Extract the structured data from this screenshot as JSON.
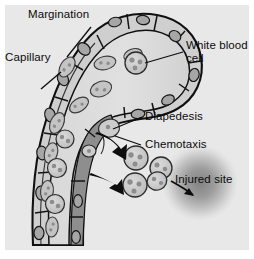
{
  "figure": {
    "background_color": "#ffffff",
    "panel_color": "#e8e8e8"
  },
  "labels": {
    "margination": "Margination",
    "capillary": "Capillary",
    "white_blood_cell_line1": "White blood",
    "white_blood_cell_line2": "cell",
    "diapedesis": "Diapedesis",
    "chemotaxis": "Chemotaxis",
    "injured_site": "Injured site"
  },
  "colors": {
    "ink": "#0b0b0b",
    "vessel_wall": "#b9b9b9",
    "vessel_lumen": "#dcdcdc",
    "vessel_dark_band": "#8a8a8a",
    "red_blood_cell": "#c2c2c2",
    "red_blood_cell_detail": "#8e8e8e",
    "white_blood_cell": "#cfcfcf",
    "white_blood_cell_nucleus": "#909090",
    "endothelial_nucleus": "#9a9a9a",
    "injury_center": "#8f8f8f",
    "background": "#e8e8e8"
  },
  "structures": {
    "vessel_name": "capillary-loop",
    "vessel_description": "hairpin capillary loop running up, arching right, and descending",
    "migrating_cells_outside": 4,
    "red_blood_cells_in_lumen": 11,
    "endothelial_nuclei": 12,
    "arrows": [
      {
        "name": "chemotaxis-arrow-upper",
        "from": "vessel wall",
        "to": "migrating leukocyte upper"
      },
      {
        "name": "chemotaxis-arrow-lower",
        "from": "vessel wall",
        "to": "migrating leukocyte lower"
      },
      {
        "name": "injury-attraction-arrow",
        "from": "leukocyte cluster",
        "to": "injured site"
      }
    ],
    "leader_lines": [
      {
        "name": "margination-leader",
        "label": "Margination"
      },
      {
        "name": "capillary-leader",
        "label": "Capillary"
      },
      {
        "name": "white-blood-cell-leader",
        "label": "White blood cell"
      },
      {
        "name": "diapedesis-leader",
        "label": "Diapedesis"
      },
      {
        "name": "chemotaxis-leader",
        "label": "Chemotaxis"
      }
    ]
  }
}
